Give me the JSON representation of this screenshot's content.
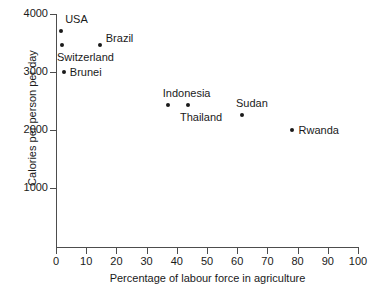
{
  "chart_data": {
    "type": "scatter",
    "title": "",
    "xlabel": "Percentage of labour force in agriculture",
    "ylabel": "Calories per person per day",
    "xlim": [
      0,
      100
    ],
    "ylim": [
      0,
      4000
    ],
    "xticks": [
      "0",
      "10",
      "20",
      "30",
      "40",
      "50",
      "60",
      "70",
      "80",
      "90",
      "100"
    ],
    "yticks": [
      "1000",
      "2000",
      "3000",
      "4000"
    ],
    "grid": false,
    "legend": "none",
    "marker_color": "#1a1a1a",
    "axis_color": "#4d4d4d",
    "points": [
      {
        "label": "USA",
        "x": 1.7,
        "y": 3710,
        "label_dx": 4,
        "label_dy": -17
      },
      {
        "label": "Switzerland",
        "x": 2.0,
        "y": 3465,
        "label_dx": -5,
        "label_dy": 7
      },
      {
        "label": "Brazil",
        "x": 14.5,
        "y": 3465,
        "label_dx": 6,
        "label_dy": -12
      },
      {
        "label": "Brunei",
        "x": 2.6,
        "y": 3000,
        "label_dx": 6,
        "label_dy": -5
      },
      {
        "label": "Indonesia",
        "x": 37.0,
        "y": 2430,
        "label_dx": -5,
        "label_dy": -17
      },
      {
        "label": "Thailand",
        "x": 43.7,
        "y": 2430,
        "label_dx": -8,
        "label_dy": 7
      },
      {
        "label": "Sudan",
        "x": 61.6,
        "y": 2260,
        "label_dx": -6,
        "label_dy": -17
      },
      {
        "label": "Rwanda",
        "x": 78.0,
        "y": 2000,
        "label_dx": 7,
        "label_dy": -5
      }
    ]
  }
}
